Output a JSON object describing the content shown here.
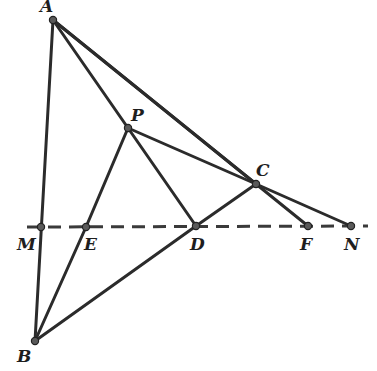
{
  "diagram": {
    "type": "geometry",
    "points": {
      "A": {
        "label": "A",
        "x": 53,
        "y": 20,
        "lx": 40,
        "ly": 12
      },
      "B": {
        "label": "B",
        "x": 35,
        "y": 341,
        "lx": 17,
        "ly": 362
      },
      "C": {
        "label": "C",
        "x": 256,
        "y": 184,
        "lx": 256,
        "ly": 176
      },
      "P": {
        "label": "P",
        "x": 128,
        "y": 128,
        "lx": 131,
        "ly": 121
      },
      "M": {
        "label": "M",
        "x": 41,
        "y": 227,
        "lx": 17,
        "ly": 250
      },
      "E": {
        "label": "E",
        "x": 86,
        "y": 227,
        "lx": 84,
        "ly": 250
      },
      "D": {
        "label": "D",
        "x": 196,
        "y": 226,
        "lx": 190,
        "ly": 250
      },
      "F": {
        "label": "F",
        "x": 308,
        "y": 226,
        "lx": 300,
        "ly": 250
      },
      "N": {
        "label": "N",
        "x": 351,
        "y": 226,
        "lx": 344,
        "ly": 250
      }
    },
    "segments": [
      [
        "A",
        "B"
      ],
      [
        "A",
        "F"
      ],
      [
        "A",
        "C"
      ],
      [
        "A",
        "P"
      ],
      [
        "P",
        "E"
      ],
      [
        "E",
        "B"
      ],
      [
        "P",
        "D"
      ],
      [
        "P",
        "C"
      ],
      [
        "C",
        "N"
      ],
      [
        "B",
        "D"
      ],
      [
        "D",
        "C"
      ]
    ],
    "dashed_line": {
      "x1": 27,
      "y1": 227,
      "x2": 368,
      "y2": 226,
      "through": [
        "M",
        "E",
        "D",
        "F",
        "N"
      ]
    },
    "colors": {
      "line": "#2b2b2b",
      "point_fill": "#5a5a5a",
      "background": "#ffffff"
    }
  }
}
